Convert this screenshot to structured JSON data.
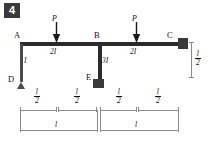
{
  "figure": {
    "number": "4",
    "type": "structural-frame-diagram"
  },
  "nodes": [
    {
      "id": "A",
      "label": "A",
      "x": 20,
      "y": 42
    },
    {
      "id": "B",
      "label": "B",
      "x": 98,
      "y": 42
    },
    {
      "id": "C",
      "label": "C",
      "x": 176,
      "y": 42
    },
    {
      "id": "D",
      "label": "D",
      "x": 20,
      "y": 82
    },
    {
      "id": "E",
      "label": "E",
      "x": 98,
      "y": 78
    }
  ],
  "members": [
    {
      "id": "AB",
      "label": "2I",
      "from": "A",
      "to": "B",
      "orientation": "horizontal"
    },
    {
      "id": "BC",
      "label": "2I",
      "from": "B",
      "to": "C",
      "orientation": "horizontal"
    },
    {
      "id": "AD",
      "label": "I",
      "from": "A",
      "to": "D",
      "orientation": "vertical"
    },
    {
      "id": "BE",
      "label": "3I",
      "from": "B",
      "to": "E",
      "orientation": "vertical"
    }
  ],
  "loads": [
    {
      "id": "P1",
      "label": "P",
      "member": "AB",
      "x": 56,
      "direction": "down"
    },
    {
      "id": "P2",
      "label": "P",
      "member": "BC",
      "x": 136,
      "direction": "down"
    }
  ],
  "supports": [
    {
      "id": "D",
      "type": "pin",
      "node": "D"
    },
    {
      "id": "E",
      "type": "fixed",
      "node": "E"
    },
    {
      "id": "C",
      "type": "fixed",
      "node": "C"
    }
  ],
  "dimensions": {
    "upper_row": [
      {
        "id": "dim-A-P1",
        "numerator": "l",
        "denominator": "2"
      },
      {
        "id": "dim-P1-B",
        "numerator": "l",
        "denominator": "2"
      },
      {
        "id": "dim-B-P2",
        "numerator": "l",
        "denominator": "2"
      },
      {
        "id": "dim-P2-C",
        "numerator": "l",
        "denominator": "2"
      }
    ],
    "lower_row": [
      {
        "id": "dim-span-AB",
        "label": "l"
      },
      {
        "id": "dim-span-BC",
        "label": "l"
      }
    ],
    "vertical_right": {
      "id": "dim-col-height",
      "numerator": "l",
      "denominator": "2"
    }
  },
  "colors": {
    "member": "#2b2b2b",
    "support": "#3a3a3a",
    "dimension": "#8a8a8a",
    "badge_bg": "#3a3a3a",
    "badge_text": "#ffffff",
    "background": "#ffffff"
  }
}
